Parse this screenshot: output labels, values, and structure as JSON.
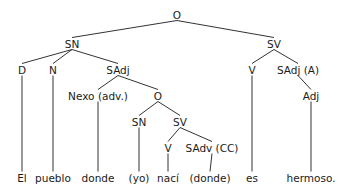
{
  "diagram": {
    "type": "syntax-tree",
    "colors": {
      "line": "#333333",
      "text": "#1a1a1a",
      "background": "#ffffff"
    },
    "nodes": [
      {
        "id": "o_root",
        "label": "O",
        "x": 177,
        "y": 15
      },
      {
        "id": "sn_main",
        "label": "SN",
        "x": 72,
        "y": 44
      },
      {
        "id": "sv_main",
        "label": "SV",
        "x": 274,
        "y": 44
      },
      {
        "id": "d",
        "label": "D",
        "x": 22,
        "y": 70
      },
      {
        "id": "n",
        "label": "N",
        "x": 53,
        "y": 70
      },
      {
        "id": "sadj",
        "label": "SAdj",
        "x": 118,
        "y": 70
      },
      {
        "id": "v_main",
        "label": "V",
        "x": 252,
        "y": 70
      },
      {
        "id": "sadj_a",
        "label": "SAdj (A)",
        "x": 298,
        "y": 70
      },
      {
        "id": "nexo",
        "label": "Nexo (adv.)",
        "x": 98,
        "y": 96
      },
      {
        "id": "o_sub",
        "label": "O",
        "x": 158,
        "y": 96
      },
      {
        "id": "adj",
        "label": "Adj",
        "x": 311,
        "y": 96
      },
      {
        "id": "sn_sub",
        "label": "SN",
        "x": 139,
        "y": 122
      },
      {
        "id": "sv_sub",
        "label": "SV",
        "x": 180,
        "y": 122
      },
      {
        "id": "v_sub",
        "label": "V",
        "x": 168,
        "y": 148
      },
      {
        "id": "sadv_cc",
        "label": "SAdv (CC)",
        "x": 212,
        "y": 148
      },
      {
        "id": "w_el",
        "label": "El",
        "x": 22,
        "y": 178
      },
      {
        "id": "w_pueblo",
        "label": "pueblo",
        "x": 53,
        "y": 178
      },
      {
        "id": "w_donde",
        "label": "donde",
        "x": 98,
        "y": 178
      },
      {
        "id": "w_yo",
        "label": "(yo)",
        "x": 139,
        "y": 178
      },
      {
        "id": "w_naci",
        "label": "nací",
        "x": 168,
        "y": 178
      },
      {
        "id": "w_donde2",
        "label": "(donde)",
        "x": 210,
        "y": 178
      },
      {
        "id": "w_es",
        "label": "es",
        "x": 252,
        "y": 178
      },
      {
        "id": "w_hermoso",
        "label": "hermoso.",
        "x": 311,
        "y": 178
      }
    ],
    "edges": [
      [
        "o_root",
        "sn_main"
      ],
      [
        "o_root",
        "sv_main"
      ],
      [
        "sn_main",
        "d"
      ],
      [
        "sn_main",
        "n"
      ],
      [
        "sn_main",
        "sadj"
      ],
      [
        "sv_main",
        "v_main"
      ],
      [
        "sv_main",
        "sadj_a"
      ],
      [
        "sadj",
        "nexo"
      ],
      [
        "sadj",
        "o_sub"
      ],
      [
        "sadj_a",
        "adj"
      ],
      [
        "o_sub",
        "sn_sub"
      ],
      [
        "o_sub",
        "sv_sub"
      ],
      [
        "sv_sub",
        "v_sub"
      ],
      [
        "sv_sub",
        "sadv_cc"
      ],
      [
        "d",
        "w_el"
      ],
      [
        "n",
        "w_pueblo"
      ],
      [
        "nexo",
        "w_donde"
      ],
      [
        "sn_sub",
        "w_yo"
      ],
      [
        "v_sub",
        "w_naci"
      ],
      [
        "sadv_cc",
        "w_donde2"
      ],
      [
        "v_main",
        "w_es"
      ],
      [
        "adj",
        "w_hermoso"
      ]
    ]
  }
}
